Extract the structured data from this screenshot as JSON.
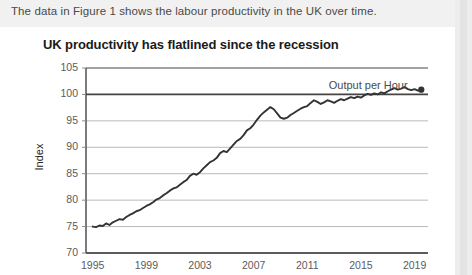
{
  "header": {
    "text": "The data in Figure 1 shows the labour productivity in the UK over time."
  },
  "figure": {
    "title": "UK productivity has flatlined since the recession",
    "legend_label": "Output per Hour"
  },
  "chart_data": {
    "type": "line",
    "title": "UK productivity has flatlined since the recession",
    "xlabel": "",
    "ylabel": "Index",
    "xlim": [
      1994.5,
      2020.0
    ],
    "ylim": [
      70,
      105
    ],
    "yticks": [
      70,
      75,
      80,
      85,
      90,
      95,
      100,
      105
    ],
    "xticks": [
      1995,
      1999,
      2003,
      2007,
      2011,
      2015,
      2019
    ],
    "grid": true,
    "baseline": 100,
    "legend_position": "top-right",
    "end_marker": true,
    "series": [
      {
        "name": "Output per Hour",
        "color": "#333333",
        "x": [
          1995.0,
          1995.25,
          1995.5,
          1995.75,
          1996.0,
          1996.25,
          1996.5,
          1996.75,
          1997.0,
          1997.25,
          1997.5,
          1997.75,
          1998.0,
          1998.25,
          1998.5,
          1998.75,
          1999.0,
          1999.25,
          1999.5,
          1999.75,
          2000.0,
          2000.25,
          2000.5,
          2000.75,
          2001.0,
          2001.25,
          2001.5,
          2001.75,
          2002.0,
          2002.25,
          2002.5,
          2002.75,
          2003.0,
          2003.25,
          2003.5,
          2003.75,
          2004.0,
          2004.25,
          2004.5,
          2004.75,
          2005.0,
          2005.25,
          2005.5,
          2005.75,
          2006.0,
          2006.25,
          2006.5,
          2006.75,
          2007.0,
          2007.25,
          2007.5,
          2007.75,
          2008.0,
          2008.25,
          2008.5,
          2008.75,
          2009.0,
          2009.25,
          2009.5,
          2009.75,
          2010.0,
          2010.25,
          2010.5,
          2010.75,
          2011.0,
          2011.25,
          2011.5,
          2011.75,
          2012.0,
          2012.25,
          2012.5,
          2012.75,
          2013.0,
          2013.25,
          2013.5,
          2013.75,
          2014.0,
          2014.25,
          2014.5,
          2014.75,
          2015.0,
          2015.25,
          2015.5,
          2015.75,
          2016.0,
          2016.25,
          2016.5,
          2016.75,
          2017.0,
          2017.25,
          2017.5,
          2017.75,
          2018.0,
          2018.25,
          2018.5,
          2018.75,
          2019.0,
          2019.25,
          2019.5
        ],
        "y": [
          75.0,
          74.9,
          75.2,
          75.1,
          75.6,
          75.3,
          75.8,
          76.1,
          76.4,
          76.3,
          76.8,
          77.2,
          77.5,
          77.9,
          78.1,
          78.5,
          78.9,
          79.2,
          79.6,
          80.1,
          80.4,
          80.9,
          81.3,
          81.8,
          82.2,
          82.4,
          82.9,
          83.4,
          83.8,
          84.6,
          85.0,
          84.8,
          85.3,
          86.0,
          86.6,
          87.2,
          87.5,
          88.0,
          88.9,
          89.3,
          89.1,
          89.8,
          90.5,
          91.2,
          91.6,
          92.3,
          93.2,
          93.6,
          94.3,
          95.2,
          96.0,
          96.6,
          97.1,
          97.6,
          97.2,
          96.4,
          95.6,
          95.4,
          95.6,
          96.1,
          96.5,
          96.9,
          97.3,
          97.6,
          97.8,
          98.4,
          98.9,
          98.6,
          98.2,
          98.5,
          98.9,
          98.7,
          98.4,
          98.8,
          99.1,
          98.9,
          99.2,
          99.5,
          99.3,
          99.6,
          99.4,
          99.8,
          100.1,
          99.9,
          100.2,
          100.0,
          100.4,
          100.2,
          100.6,
          100.9,
          101.2,
          100.9,
          101.1,
          101.4,
          101.0,
          100.8,
          101.0,
          100.7,
          100.9
        ]
      }
    ]
  }
}
